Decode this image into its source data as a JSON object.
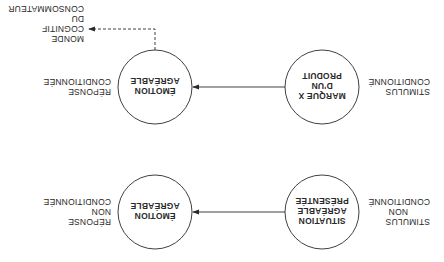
{
  "diagram": {
    "orientation": "rotated 180 degrees",
    "rows": [
      {
        "id": "unconditioned",
        "stimulus_label": [
          "STIMULUS",
          "NON",
          "CONDITIONNÉ"
        ],
        "stimulus_node": [
          "SITUATION",
          "AGRÉABLE",
          "PRÉSENTÉE"
        ],
        "response_node": [
          "ÉMOTION",
          "AGRÉABLE"
        ],
        "response_label": [
          "RÉPONSE",
          "NON",
          "CONDITIONNÉE"
        ]
      },
      {
        "id": "conditioned",
        "stimulus_label": [
          "STIMULUS",
          "CONDITIONNÉ"
        ],
        "stimulus_node": [
          "MARQUE X",
          "D'UN",
          "PRODUIT"
        ],
        "response_node": [
          "ÉMOTION",
          "AGRÉABLE"
        ],
        "response_label": [
          "RÉPONSE",
          "CONDITIONNÉE"
        ],
        "outcome_label": [
          "MONDE",
          "COGNITIF",
          "DU",
          "CONSOMMATEUR"
        ]
      }
    ],
    "colors": {
      "line": "#2a2a2a",
      "background": "#ffffff"
    }
  }
}
